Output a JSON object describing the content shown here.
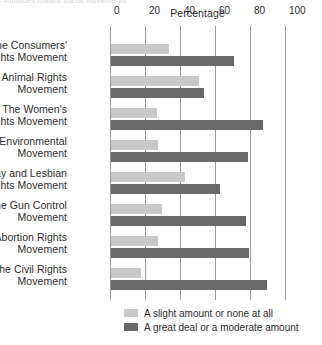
{
  "clipped_header": "Attitudes toward social movements",
  "chart_data": {
    "type": "bar",
    "orientation": "horizontal",
    "title": "",
    "xlabel": "Percentage",
    "ylabel": "",
    "xlim": [
      0,
      100
    ],
    "xticks": [
      0,
      20,
      40,
      60,
      80,
      100
    ],
    "xtick_labels": [
      "0",
      "20",
      "40",
      "60",
      "80",
      "100"
    ],
    "grid": true,
    "legend_position": "bottom",
    "categories": [
      "The Consumers' Rights Movement",
      "The Animal Rights Movement",
      "The Women's Rights Movement",
      "The Environmental Movement",
      "The Gay and Lesbian Rights Movement",
      "The Gun Control Movement",
      "The Abortion Rights Movement",
      "The Civil Rights Movement"
    ],
    "category_lines": [
      [
        "The Consumers'",
        "Rights Movement"
      ],
      [
        "The Animal Rights",
        "Movement"
      ],
      [
        "The Women's",
        "Rights Movement"
      ],
      [
        "The Environmental",
        "Movement"
      ],
      [
        "The Gay and Lesbian",
        "Rights Movement"
      ],
      [
        "The Gun Control",
        "Movement"
      ],
      [
        "The Abortion Rights",
        "Movement"
      ],
      [
        "The Civil Rights",
        "Movement"
      ]
    ],
    "series": [
      {
        "name": "A slight amount or none at all",
        "color": "#c8c8c8",
        "values": [
          33,
          50,
          26,
          27,
          42,
          29,
          27,
          17
        ]
      },
      {
        "name": "A great deal or a moderate amount",
        "color": "#676767",
        "values": [
          70,
          53,
          87,
          78,
          62,
          77,
          79,
          89
        ]
      }
    ]
  }
}
